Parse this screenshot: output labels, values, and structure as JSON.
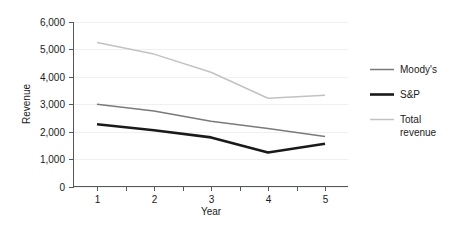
{
  "chart_data": {
    "type": "line",
    "title": "",
    "xlabel": "Year",
    "ylabel": "Revenue",
    "categories": [
      "1",
      "2",
      "3",
      "4",
      "5"
    ],
    "x": [
      1,
      2,
      3,
      4,
      5
    ],
    "xlim": [
      1,
      5
    ],
    "ylim": [
      0,
      6000
    ],
    "grid": true,
    "legend_position": "right",
    "y_ticks": [
      0,
      1000,
      2000,
      3000,
      4000,
      5000,
      6000
    ],
    "y_tick_labels": [
      "0",
      "1,000",
      "2,000",
      "3,000",
      "4,000",
      "5,000",
      "6,000"
    ],
    "x_ticks": [
      1,
      2,
      3,
      4,
      5
    ],
    "x_tick_labels": [
      "1",
      "2",
      "3",
      "4",
      "5"
    ],
    "series": [
      {
        "name": "Moody's",
        "values": [
          3000,
          2750,
          2380,
          2120,
          1820
        ],
        "color": "#7a7a7a",
        "width": 1.5
      },
      {
        "name": "S&P",
        "values": [
          2270,
          2050,
          1790,
          1240,
          1560
        ],
        "color": "#1a1a1a",
        "width": 2.6
      },
      {
        "name": "Total revenue",
        "values": [
          5250,
          4830,
          4170,
          3220,
          3330
        ],
        "color": "#c2c2c2",
        "width": 1.5
      }
    ]
  },
  "legend": {
    "entries": [
      {
        "label": "Moody's",
        "line2": ""
      },
      {
        "label": "S&P",
        "line2": ""
      },
      {
        "label": "Total",
        "line2": "revenue"
      }
    ]
  },
  "axes": {
    "y_title": "Revenue",
    "x_title": "Year"
  }
}
